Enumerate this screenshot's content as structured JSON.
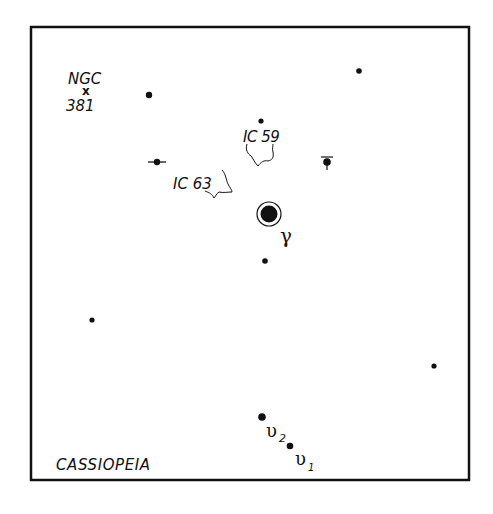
{
  "title": "CASSIOPEIA",
  "frame": {
    "x": 31,
    "y": 27,
    "width": 438,
    "height": 453,
    "stroke": "#111111"
  },
  "labels": {
    "constellation": "CASSIOPEIA",
    "ngc_top": "NGC",
    "ngc_marker": "x",
    "ngc_bottom": "381",
    "ic59": "IC 59",
    "ic63": "IC 63",
    "gamma": "γ",
    "upsilon2": "υ",
    "upsilon2_sub": "2",
    "upsilon1": "υ",
    "upsilon1_sub": "1"
  },
  "stars": [
    {
      "name": "star-near-ngc381",
      "x": 149,
      "y": 95,
      "r": 3.2
    },
    {
      "name": "star-top-right",
      "x": 359,
      "y": 71,
      "r": 2.8
    },
    {
      "name": "star-above-ic59",
      "x": 261,
      "y": 121,
      "r": 2.6
    },
    {
      "name": "star-double-left",
      "x": 157,
      "y": 162,
      "r": 3.2
    },
    {
      "name": "star-variable-right",
      "x": 327,
      "y": 162,
      "r": 3.6
    },
    {
      "name": "star-gamma-cas",
      "x": 269,
      "y": 214,
      "r": 8
    },
    {
      "name": "star-below-gamma",
      "x": 265,
      "y": 261,
      "r": 2.8
    },
    {
      "name": "star-left",
      "x": 92,
      "y": 320,
      "r": 2.6
    },
    {
      "name": "star-right",
      "x": 434,
      "y": 366,
      "r": 2.6
    },
    {
      "name": "star-upsilon2",
      "x": 262,
      "y": 417,
      "r": 3.6
    },
    {
      "name": "star-upsilon1",
      "x": 290,
      "y": 446,
      "r": 3.2
    }
  ],
  "colors": {
    "ink": "#111111",
    "background": "#ffffff"
  }
}
